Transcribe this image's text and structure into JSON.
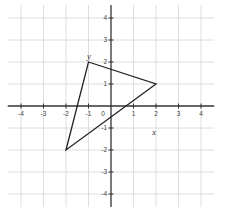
{
  "chart_data": {
    "type": "scatter",
    "title": "",
    "xlabel": "x",
    "ylabel": "y",
    "xlim": [
      -4.5,
      4.5
    ],
    "ylim": [
      -4.5,
      4.5
    ],
    "grid": true,
    "x_ticks": [
      -4,
      -3,
      -2,
      -1,
      0,
      1,
      2,
      3,
      4
    ],
    "y_ticks": [
      4,
      3,
      2,
      1,
      -1,
      -2,
      -3,
      -4
    ],
    "x_tick_labels": [
      "-4",
      "-3",
      "-2",
      "-1",
      "0",
      "1",
      "2",
      "3",
      "4"
    ],
    "y_tick_labels": [
      "4",
      "3",
      "2",
      "1",
      "-1",
      "-2",
      "-3",
      "-4"
    ],
    "shapes": [
      {
        "name": "triangle",
        "vertices": [
          [
            -1,
            2
          ],
          [
            2,
            1
          ],
          [
            -2,
            -2
          ]
        ],
        "closed": true
      }
    ]
  },
  "labels": {
    "x_axis": "x",
    "y_axis": "y"
  },
  "colors": {
    "grid": "#d6d6d6",
    "axis": "#333333",
    "shape": "#222222"
  }
}
